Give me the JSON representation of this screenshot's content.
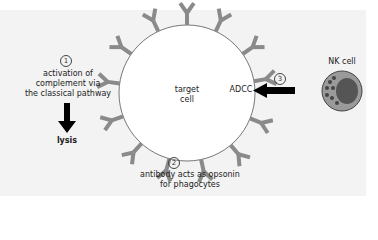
{
  "diagram": {
    "target_cell": {
      "line1": "target",
      "line2": "cell"
    },
    "step1": {
      "number": "1",
      "line1": "activation of",
      "line2": "complement via",
      "line3": "the classical pathway",
      "result": "lysis"
    },
    "step2": {
      "number": "2",
      "line1": "antibody acts as opsonin",
      "line2": "for phagocytes"
    },
    "step3": {
      "number": "3",
      "label": "ADCC"
    },
    "nk_cell": {
      "label": "NK cell"
    },
    "colors": {
      "antibody": "#8a8a8a",
      "nk_cell_body": "#9a9a9a",
      "nk_nucleus": "#555555",
      "arrow": "#000000",
      "panel": "#f3f3f3"
    }
  }
}
